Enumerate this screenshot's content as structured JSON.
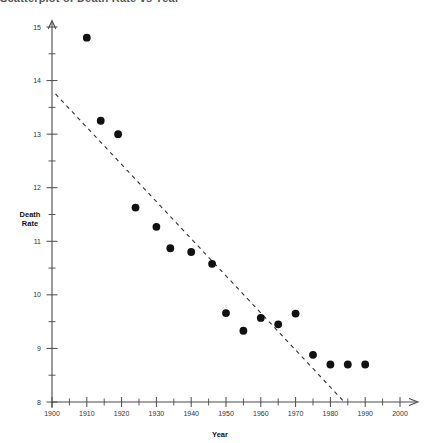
{
  "title_clipped": "Scatterplot of Death Rate vs Year",
  "chart_data": {
    "type": "scatter",
    "title": "",
    "xlabel": "Year",
    "ylabel": "Death Rate",
    "ylabel_line1": "Death",
    "ylabel_line2": "Rate",
    "xlim": [
      1900,
      2000
    ],
    "ylim": [
      8,
      15
    ],
    "grid": false,
    "legend": false,
    "x_major_step": 10,
    "x_minor_step": 5,
    "y_major_step": 1,
    "y_minor_step": 0.5,
    "xticks": [
      1900,
      1910,
      1920,
      1930,
      1940,
      1950,
      1960,
      1970,
      1980,
      1990,
      2000
    ],
    "xtick_labels": [
      "1900",
      "1910",
      "1920",
      "1930",
      "1940",
      "1950",
      "1960",
      "1970",
      "1980",
      "1990",
      "2000"
    ],
    "yticks": [
      8,
      9,
      10,
      11,
      12,
      13,
      14,
      15
    ],
    "ytick_labels": [
      "8",
      "9",
      "10",
      "11",
      "12",
      "13",
      "14",
      "15"
    ],
    "marker": "filled-circle",
    "marker_color": "#111111",
    "marker_size": 4.6,
    "series": [
      {
        "name": "Death Rate",
        "x": [
          1910,
          1914,
          1919,
          1924,
          1930,
          1934,
          1940,
          1946,
          1950,
          1955,
          1960,
          1965,
          1970,
          1975,
          1980,
          1985,
          1990
        ],
        "y": [
          14.8,
          13.25,
          13.0,
          11.63,
          11.27,
          10.87,
          10.8,
          10.58,
          9.66,
          9.33,
          9.57,
          9.45,
          9.65,
          8.88,
          8.7,
          8.7,
          8.7
        ]
      }
    ],
    "trend_line": {
      "style": "dashed",
      "color": "#333333",
      "x": [
        1901,
        1984
      ],
      "y": [
        13.75,
        8.0
      ]
    },
    "annotations": []
  }
}
